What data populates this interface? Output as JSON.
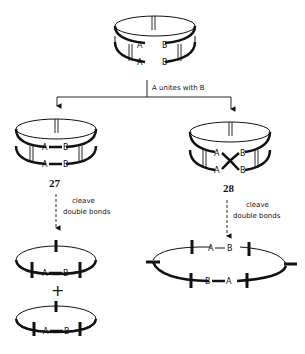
{
  "diagram": {
    "start": {
      "labels": {
        "top_left": "A",
        "top_right": "B",
        "bottom_left": "A",
        "bottom_right": "B"
      }
    },
    "step1": {
      "label": "A unites with B"
    },
    "left_branch": {
      "compound_number": "27",
      "labels": {
        "top_a": "A",
        "top_b": "B",
        "bottom_a": "A",
        "bottom_b": "B"
      },
      "cleave_label_line1": "cleave",
      "cleave_label_line2": "double bonds",
      "product1": {
        "a": "A",
        "b": "B"
      },
      "plus": "+",
      "product2": {
        "a": "A",
        "b": "B"
      }
    },
    "right_branch": {
      "compound_number": "28",
      "labels": {
        "top_a": "A",
        "top_b": "B",
        "bottom_a": "A",
        "bottom_b": "B"
      },
      "cleave_label_line1": "cleave",
      "cleave_label_line2": "double bonds",
      "product": {
        "top_a": "A",
        "top_b": "B",
        "bottom_b": "B",
        "bottom_a": "A"
      }
    }
  }
}
